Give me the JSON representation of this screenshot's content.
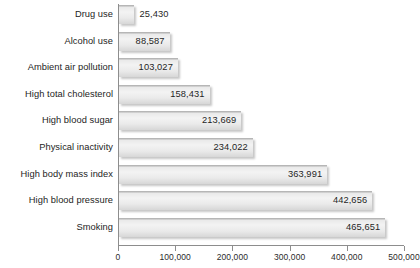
{
  "chart_data": {
    "type": "bar",
    "orientation": "horizontal",
    "title": "",
    "subtitle": "",
    "xlabel": "",
    "ylabel": "",
    "xlim": [
      0,
      500000
    ],
    "grid": false,
    "legend": null,
    "categories": [
      "Drug use",
      "Alcohol use",
      "Ambient air pollution",
      "High total cholesterol",
      "High blood sugar",
      "Physical inactivity",
      "High body mass index",
      "High blood pressure",
      "Smoking"
    ],
    "values": [
      25430,
      88587,
      103027,
      158431,
      213669,
      234022,
      363991,
      442656,
      465651
    ],
    "value_labels": [
      "25,430",
      "88,587",
      "103,027",
      "158,431",
      "213,669",
      "234,022",
      "363,991",
      "442,656",
      "465,651"
    ],
    "label_placement": [
      "outside",
      "inside",
      "inside",
      "inside",
      "inside",
      "inside",
      "inside",
      "inside",
      "inside"
    ],
    "xticks": [
      0,
      100000,
      200000,
      300000,
      400000,
      500000
    ],
    "xtick_labels": [
      "0",
      "100,000",
      "200,000",
      "300,000",
      "400,000",
      "500,000"
    ],
    "colors": {
      "bar_top_edge": "#b6b6b6",
      "bar_fill_light": "#f3f3f3",
      "bar_fill_dark": "#d7d7d7",
      "axis": "#8d8d8d",
      "text": "#242424",
      "background": "#ffffff"
    }
  }
}
